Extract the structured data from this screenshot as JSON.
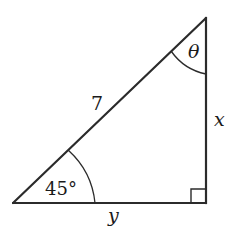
{
  "diagram": {
    "type": "right-triangle",
    "colors": {
      "stroke": "#2b2b2b",
      "text": "#1a1a1a",
      "background": "#ffffff"
    },
    "vertices": {
      "bottom_left": [
        13,
        203
      ],
      "top_right": [
        206,
        18
      ],
      "bottom_right": [
        206,
        203
      ]
    },
    "labels": {
      "hypotenuse": "7",
      "vertical_side": "x",
      "horizontal_side": "y",
      "bottom_left_angle": "45°",
      "top_angle": "θ"
    },
    "right_angle_marker": true
  }
}
